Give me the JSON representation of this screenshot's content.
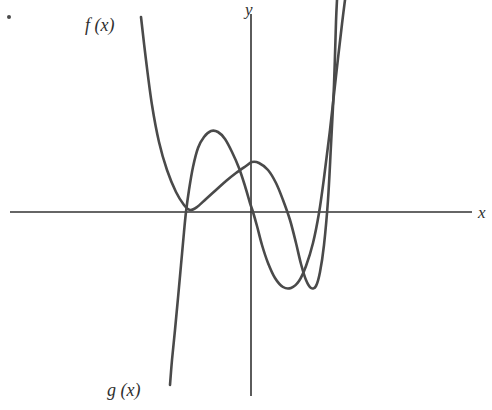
{
  "figure": {
    "background": "#ffffff",
    "width": 492,
    "height": 410,
    "corner_marker": "bullet-dot"
  },
  "labels": {
    "f_label": "f (x)",
    "g_label": "g (x)",
    "y_axis": "y",
    "x_axis": "x"
  },
  "chart_data": {
    "type": "line",
    "title": "",
    "xlabel": "x",
    "ylabel": "y",
    "grid": false,
    "legend": "inline-curve-labels",
    "axis_color": "#333333",
    "curve_color": "#4a4a4a",
    "origin_px": [
      251,
      212
    ],
    "x_axis_extent_px": [
      10,
      472
    ],
    "y_axis_extent_px": [
      14,
      396
    ],
    "xlim": [
      -3.1,
      3.6
    ],
    "ylim": [
      -3.2,
      3.4
    ],
    "annotations": [
      "f (x) upward-opening even-degree curve with double root on left and root on right",
      "g (x) cubic-like curve rising left to right through three x-intercepts"
    ],
    "series": [
      {
        "name": "f (x)",
        "label": "f (x)",
        "color": "#4a4a4a",
        "description": "Quartic-shaped curve, tangent to the x-axis at the left root, local maximum just right of the y-axis, local minimum below the axis, then rising steeply on the right.",
        "x_intercepts": [
          -1.0,
          1.0
        ],
        "local_maximum": [
          0.05,
          0.45
        ],
        "local_minimum": [
          0.55,
          -0.85
        ],
        "points_px": [
          [
            141,
            17
          ],
          [
            146,
            60
          ],
          [
            152,
            105
          ],
          [
            159,
            142
          ],
          [
            167,
            170
          ],
          [
            176,
            192
          ],
          [
            184,
            205
          ],
          [
            190,
            210
          ],
          [
            197,
            207
          ],
          [
            206,
            199
          ],
          [
            216,
            190
          ],
          [
            226,
            181
          ],
          [
            236,
            173
          ],
          [
            246,
            166
          ],
          [
            252,
            162
          ],
          [
            259,
            163
          ],
          [
            268,
            170
          ],
          [
            276,
            183
          ],
          [
            283,
            200
          ],
          [
            290,
            220
          ],
          [
            296,
            243
          ],
          [
            301,
            264
          ],
          [
            306,
            280
          ],
          [
            311,
            288
          ],
          [
            316,
            286
          ],
          [
            320,
            272
          ],
          [
            324,
            245
          ],
          [
            328,
            200
          ],
          [
            331,
            145
          ],
          [
            334,
            85
          ],
          [
            336,
            22
          ],
          [
            337,
            0
          ]
        ]
      },
      {
        "name": "g (x)",
        "label": "g (x)",
        "color": "#4a4a4a",
        "description": "Cubic-shaped curve rising from lower left, crossing the x-axis at the left root, local maximum above the axis, crossing near the origin, local minimum below the axis, then rising steeply through the right root.",
        "x_intercepts": [
          -1.0,
          0.0,
          1.0
        ],
        "local_maximum": [
          -0.55,
          1.0
        ],
        "local_minimum": [
          0.35,
          -0.95
        ],
        "points_px": [
          [
            170,
            385
          ],
          [
            172,
            360
          ],
          [
            175,
            330
          ],
          [
            178,
            298
          ],
          [
            181,
            265
          ],
          [
            184,
            232
          ],
          [
            186,
            212
          ],
          [
            189,
            190
          ],
          [
            193,
            167
          ],
          [
            198,
            148
          ],
          [
            204,
            137
          ],
          [
            211,
            131
          ],
          [
            218,
            132
          ],
          [
            225,
            139
          ],
          [
            232,
            152
          ],
          [
            239,
            168
          ],
          [
            245,
            186
          ],
          [
            250,
            203
          ],
          [
            253,
            212
          ],
          [
            257,
            226
          ],
          [
            262,
            245
          ],
          [
            268,
            263
          ],
          [
            275,
            278
          ],
          [
            283,
            287
          ],
          [
            291,
            288
          ],
          [
            299,
            281
          ],
          [
            306,
            266
          ],
          [
            313,
            243
          ],
          [
            319,
            213
          ],
          [
            324,
            178
          ],
          [
            330,
            130
          ],
          [
            336,
            76
          ],
          [
            342,
            24
          ],
          [
            345,
            0
          ]
        ]
      }
    ]
  }
}
